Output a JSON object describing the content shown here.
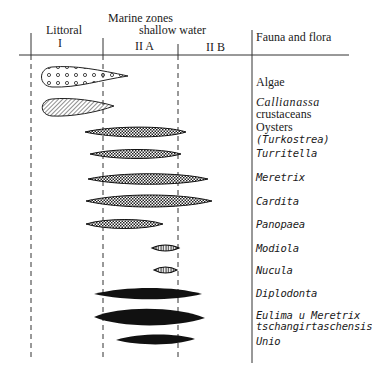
{
  "header": {
    "title": "Marine zones",
    "subtitle": "shallow water",
    "zone_littoral": "Littoral",
    "zone_I": "I",
    "zone_IIA": "II A",
    "zone_IIB": "II B",
    "fauna_header": "Fauna and flora"
  },
  "zones": [
    {
      "id": "I",
      "name": "Littoral",
      "x_start": 31,
      "x_end": 103
    },
    {
      "id": "IIA",
      "name": "shallow water",
      "x_start": 103,
      "x_end": 178
    },
    {
      "id": "IIB",
      "name": "shallow water",
      "x_start": 178,
      "x_end": 252
    }
  ],
  "organisms": [
    {
      "name": "Algae",
      "pattern": "circles",
      "x_start": 43,
      "x_end": 128,
      "y": 77
    },
    {
      "name": "Callianassa",
      "name2": "crustaceans",
      "pattern": "hatched",
      "x_start": 43,
      "x_end": 114,
      "y": 107
    },
    {
      "name": "Oysters",
      "name2": "(Turkostrea)",
      "pattern": "crosshatch",
      "x_start": 85,
      "x_end": 186,
      "y": 132
    },
    {
      "name": "Turritella",
      "pattern": "crosshatch",
      "x_start": 90,
      "x_end": 181,
      "y": 154
    },
    {
      "name": "Meretrix",
      "pattern": "crosshatch",
      "x_start": 88,
      "x_end": 208,
      "y": 179
    },
    {
      "name": "Cardita",
      "pattern": "crosshatch",
      "x_start": 86,
      "x_end": 212,
      "y": 201
    },
    {
      "name": "Panopaea",
      "pattern": "crosshatch",
      "x_start": 86,
      "x_end": 163,
      "y": 224
    },
    {
      "name": "Modiola",
      "pattern": "vertical-hatch",
      "x_start": 152,
      "x_end": 179,
      "y": 248
    },
    {
      "name": "Nucula",
      "pattern": "vertical-hatch",
      "x_start": 154,
      "x_end": 177,
      "y": 270
    },
    {
      "name": "Diplodonta",
      "pattern": "solid",
      "x_start": 94,
      "x_end": 202,
      "y": 294
    },
    {
      "name": "Eulima u Meretrix",
      "name2": "tschangirtaschensis",
      "pattern": "solid",
      "x_start": 94,
      "x_end": 205,
      "y": 317
    },
    {
      "name": "Unio",
      "pattern": "solid",
      "x_start": 116,
      "x_end": 195,
      "y": 339
    }
  ]
}
